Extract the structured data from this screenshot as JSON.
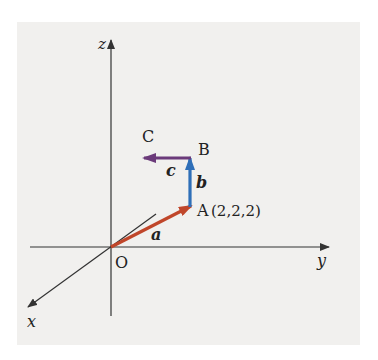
{
  "diagram": {
    "type": "3d-vector-diagram",
    "axes": {
      "x_label": "x",
      "y_label": "y",
      "z_label": "z",
      "origin_label": "O"
    },
    "points": [
      {
        "name": "O",
        "label": "O"
      },
      {
        "name": "A",
        "label": "A",
        "coords": "(2,2,2)"
      },
      {
        "name": "B",
        "label": "B"
      },
      {
        "name": "C",
        "label": "C"
      }
    ],
    "vectors": [
      {
        "name": "a",
        "label": "a",
        "from": "O",
        "to": "A",
        "color": "#c0462a"
      },
      {
        "name": "b",
        "label": "b",
        "from": "A",
        "to": "B",
        "color": "#2f6fb8"
      },
      {
        "name": "c",
        "label": "c",
        "from": "B",
        "to": "C",
        "color": "#6b3a7a"
      }
    ],
    "colors": {
      "background": "#f1f0ee",
      "axis": "#333333"
    }
  }
}
